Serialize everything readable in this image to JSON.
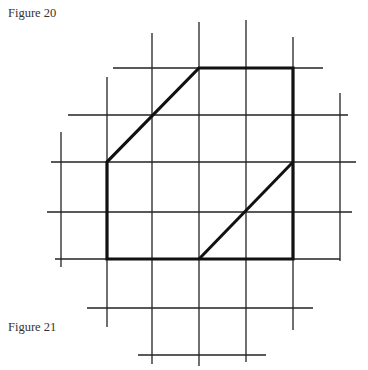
{
  "captions": {
    "top": "Figure 20",
    "bottom": "Figure 21"
  },
  "diagram": {
    "grid_vertical": [
      {
        "x": 61,
        "y1": 132,
        "y2": 267
      },
      {
        "x": 107,
        "y1": 77,
        "y2": 327
      },
      {
        "x": 152,
        "y1": 33,
        "y2": 364
      },
      {
        "x": 199,
        "y1": 22,
        "y2": 366
      },
      {
        "x": 246,
        "y1": 20,
        "y2": 362
      },
      {
        "x": 293,
        "y1": 37,
        "y2": 330
      },
      {
        "x": 340,
        "y1": 93,
        "y2": 261
      }
    ],
    "grid_horizontal": [
      {
        "y": 68,
        "x1": 113,
        "x2": 323
      },
      {
        "y": 115,
        "x1": 68,
        "x2": 348
      },
      {
        "y": 162,
        "x1": 51,
        "x2": 356
      },
      {
        "y": 212,
        "x1": 47,
        "x2": 352
      },
      {
        "y": 259,
        "x1": 55,
        "x2": 340
      },
      {
        "y": 308,
        "x1": 87,
        "x2": 313
      },
      {
        "y": 355,
        "x1": 138,
        "x2": 266
      }
    ],
    "shape_points": "199,68 293,68 293,259 107,259 107,162",
    "diagonal": {
      "x1": 293,
      "y1": 162,
      "x2": 199,
      "y2": 259
    },
    "line_color": "#1a1a1a"
  }
}
